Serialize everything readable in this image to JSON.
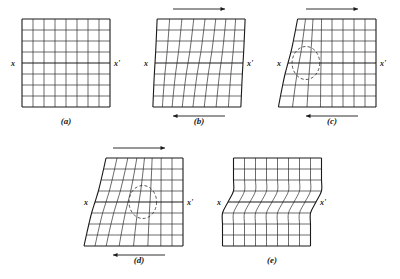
{
  "figure": {
    "background_color": "#ffffff",
    "ink_color": "#1a1a1a",
    "grid_color": "#2b2b2b"
  },
  "labels": {
    "x": "x",
    "x_prime": "x'"
  },
  "panels": [
    {
      "id": "a",
      "caption": "(a)",
      "state": "undeformed",
      "has_top_arrow": false,
      "has_bottom_arrow": false,
      "has_loop": false,
      "cols": 8,
      "rows": 8,
      "x_label": "x",
      "x_prime_label": "x'"
    },
    {
      "id": "b",
      "caption": "(b)",
      "state": "elastic-shear-bowing",
      "has_top_arrow": true,
      "has_bottom_arrow": true,
      "top_arrow_direction": "right",
      "bottom_arrow_direction": "left",
      "has_loop": false,
      "cols": 8,
      "rows": 8,
      "x_label": "x",
      "x_prime_label": "x'"
    },
    {
      "id": "c",
      "caption": "(c)",
      "state": "dislocation-nucleated-at-left-edge",
      "has_top_arrow": true,
      "has_bottom_arrow": true,
      "top_arrow_direction": "right",
      "bottom_arrow_direction": "left",
      "has_loop": true,
      "loop_position": "left",
      "cols": 8,
      "rows": 8,
      "x_label": "x",
      "x_prime_label": "x'"
    },
    {
      "id": "d",
      "caption": "(d)",
      "state": "dislocation-glided-to-center",
      "has_top_arrow": true,
      "has_bottom_arrow": true,
      "top_arrow_direction": "right",
      "bottom_arrow_direction": "left",
      "has_loop": true,
      "loop_position": "center",
      "cols": 8,
      "rows": 8,
      "x_label": "x",
      "x_prime_label": "x'"
    },
    {
      "id": "e",
      "caption": "(e)",
      "state": "slip-step-complete",
      "has_top_arrow": false,
      "has_bottom_arrow": false,
      "has_loop": false,
      "offset_cells": 1,
      "cols": 8,
      "rows": 8,
      "x_label": "x",
      "x_prime_label": "x'"
    }
  ],
  "geometry": {
    "cell": 11,
    "panel_a": {
      "left": 22,
      "top": 19,
      "cols": 8,
      "rows": 8
    },
    "panel_b": {
      "left": 155,
      "top": 19,
      "cols": 8,
      "rows": 8
    },
    "panel_c": {
      "left": 288,
      "top": 19,
      "cols": 8,
      "rows": 8
    },
    "panel_d": {
      "left": 95,
      "top": 158,
      "cols": 8,
      "rows": 8
    },
    "panel_e": {
      "left": 228,
      "top": 158,
      "cols": 8,
      "rows": 8
    }
  }
}
